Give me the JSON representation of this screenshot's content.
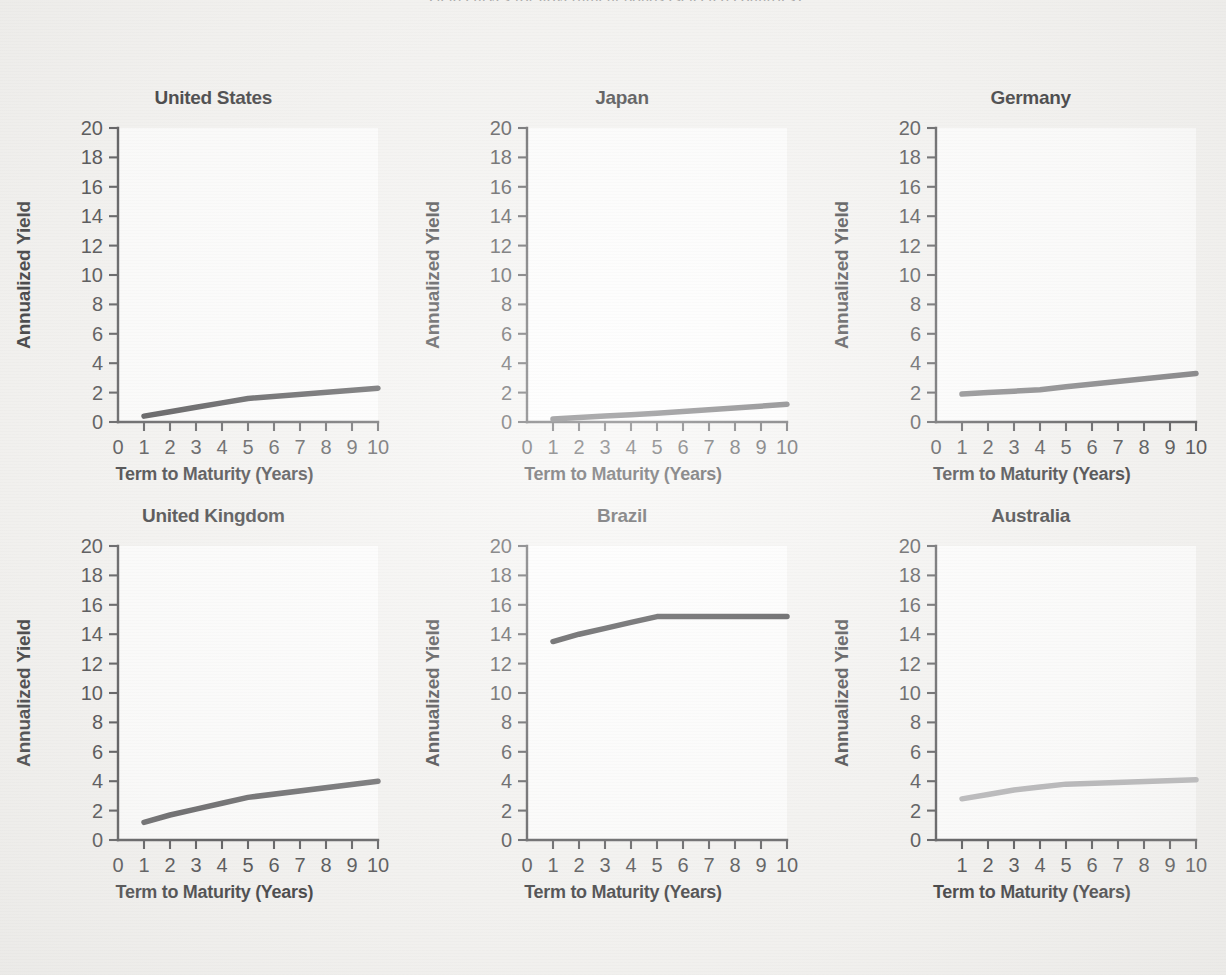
{
  "figure": {
    "cut_caption": "Yield curves for government bonds (selected countries)",
    "axis_titles": {
      "x": "Term to Maturity (Years)",
      "y": "Annualized Yield"
    }
  },
  "chart_data": [
    {
      "type": "line",
      "title": "United States",
      "xlabel": "Term to Maturity (Years)",
      "ylabel": "Annualized Yield",
      "xlim": [
        0,
        10
      ],
      "ylim": [
        0,
        20
      ],
      "xticks": [
        0,
        1,
        2,
        3,
        4,
        5,
        6,
        7,
        8,
        9,
        10
      ],
      "xtick_labels": [
        "0",
        "1",
        "2",
        "3",
        "4",
        "5",
        "6",
        "7",
        "8",
        "9",
        "10"
      ],
      "yticks": [
        0,
        2,
        4,
        6,
        8,
        10,
        12,
        14,
        16,
        18,
        20
      ],
      "ytick_labels": [
        "0",
        "2",
        "4",
        "6",
        "8",
        "10",
        "12",
        "14",
        "16",
        "18",
        "20"
      ],
      "grid": false,
      "legend": "none",
      "color": "#2e2e31",
      "x": [
        1,
        2,
        3,
        4,
        5,
        10
      ],
      "values": [
        0.4,
        0.7,
        1.0,
        1.3,
        1.6,
        2.3
      ]
    },
    {
      "type": "line",
      "title": "Japan",
      "xlabel": "Term to Maturity (Years)",
      "ylabel": "Annualized Yield",
      "xlim": [
        0,
        10
      ],
      "ylim": [
        0,
        20
      ],
      "xticks": [
        0,
        1,
        2,
        3,
        4,
        5,
        6,
        7,
        8,
        9,
        10
      ],
      "xtick_labels": [
        "0",
        "1",
        "2",
        "3",
        "4",
        "5",
        "6",
        "7",
        "8",
        "9",
        "10"
      ],
      "yticks": [
        0,
        2,
        4,
        6,
        8,
        10,
        12,
        14,
        16,
        18,
        20
      ],
      "ytick_labels": [
        "0",
        "2",
        "4",
        "6",
        "8",
        "10",
        "12",
        "14",
        "16",
        "18",
        "20"
      ],
      "grid": false,
      "legend": "none",
      "color": "#4d4d50",
      "x": [
        1,
        2,
        3,
        4,
        5,
        10
      ],
      "values": [
        0.2,
        0.3,
        0.4,
        0.5,
        0.6,
        1.2
      ]
    },
    {
      "type": "line",
      "title": "Germany",
      "xlabel": "Term to Maturity (Years)",
      "ylabel": "Annualized Yield",
      "xlim": [
        0,
        10
      ],
      "ylim": [
        0,
        20
      ],
      "xticks": [
        0,
        1,
        2,
        3,
        4,
        5,
        6,
        7,
        8,
        9,
        10
      ],
      "xtick_labels": [
        "0",
        "1",
        "2",
        "3",
        "4",
        "5",
        "6",
        "7",
        "8",
        "9",
        "10"
      ],
      "yticks": [
        0,
        2,
        4,
        6,
        8,
        10,
        12,
        14,
        16,
        18,
        20
      ],
      "ytick_labels": [
        "0",
        "2",
        "4",
        "6",
        "8",
        "10",
        "12",
        "14",
        "16",
        "18",
        "20"
      ],
      "grid": false,
      "legend": "none",
      "color": "#6b6b6e",
      "x": [
        1,
        2,
        3,
        4,
        5,
        10
      ],
      "values": [
        1.9,
        2.0,
        2.1,
        2.2,
        2.4,
        3.3
      ]
    },
    {
      "type": "line",
      "title": "United Kingdom",
      "xlabel": "Term to Maturity (Years)",
      "ylabel": "Annualized Yield",
      "xlim": [
        0,
        10
      ],
      "ylim": [
        0,
        20
      ],
      "xticks": [
        0,
        1,
        2,
        3,
        4,
        5,
        6,
        7,
        8,
        9,
        10
      ],
      "xtick_labels": [
        "0",
        "1",
        "2",
        "3",
        "4",
        "5",
        "6",
        "7",
        "8",
        "9",
        "10"
      ],
      "yticks": [
        0,
        2,
        4,
        6,
        8,
        10,
        12,
        14,
        16,
        18,
        20
      ],
      "ytick_labels": [
        "0",
        "2",
        "4",
        "6",
        "8",
        "10",
        "12",
        "14",
        "16",
        "18",
        "20"
      ],
      "grid": false,
      "legend": "none",
      "color": "#4a4a4d",
      "x": [
        1,
        2,
        3,
        4,
        5,
        10
      ],
      "values": [
        1.2,
        1.7,
        2.1,
        2.5,
        2.9,
        4.0
      ]
    },
    {
      "type": "line",
      "title": "Brazil",
      "xlabel": "Term to Maturity (Years)",
      "ylabel": "Annualized Yield",
      "xlim": [
        0,
        10
      ],
      "ylim": [
        0,
        20
      ],
      "xticks": [
        0,
        1,
        2,
        3,
        4,
        5,
        6,
        7,
        8,
        9,
        10
      ],
      "xtick_labels": [
        "0",
        "1",
        "2",
        "3",
        "4",
        "5",
        "6",
        "7",
        "8",
        "9",
        "10"
      ],
      "yticks": [
        0,
        2,
        4,
        6,
        8,
        10,
        12,
        14,
        16,
        18,
        20
      ],
      "ytick_labels": [
        "0",
        "2",
        "4",
        "6",
        "8",
        "10",
        "12",
        "14",
        "16",
        "18",
        "20"
      ],
      "grid": false,
      "legend": "none",
      "color": "#18181b",
      "x": [
        1,
        2,
        3,
        4,
        5,
        10
      ],
      "values": [
        13.5,
        14.0,
        14.4,
        14.8,
        15.2,
        15.2
      ]
    },
    {
      "type": "line",
      "title": "Australia",
      "xlabel": "Term to Maturity (Years)",
      "ylabel": "Annualized Yield",
      "xlim": [
        0,
        10
      ],
      "ylim": [
        0,
        20
      ],
      "xticks": [
        1,
        2,
        3,
        4,
        5,
        6,
        7,
        8,
        9,
        10
      ],
      "xtick_labels": [
        "1",
        "2",
        "3",
        "4",
        "5",
        "6",
        "7",
        "8",
        "9",
        "10"
      ],
      "yticks": [
        0,
        2,
        4,
        6,
        8,
        10,
        12,
        14,
        16,
        18,
        20
      ],
      "ytick_labels": [
        "0",
        "2",
        "4",
        "6",
        "8",
        "10",
        "12",
        "14",
        "16",
        "18",
        "20"
      ],
      "grid": false,
      "legend": "none",
      "color": "#a9a9ac",
      "x": [
        1,
        2,
        3,
        4,
        5,
        10
      ],
      "values": [
        2.8,
        3.1,
        3.4,
        3.6,
        3.8,
        4.1
      ]
    }
  ]
}
